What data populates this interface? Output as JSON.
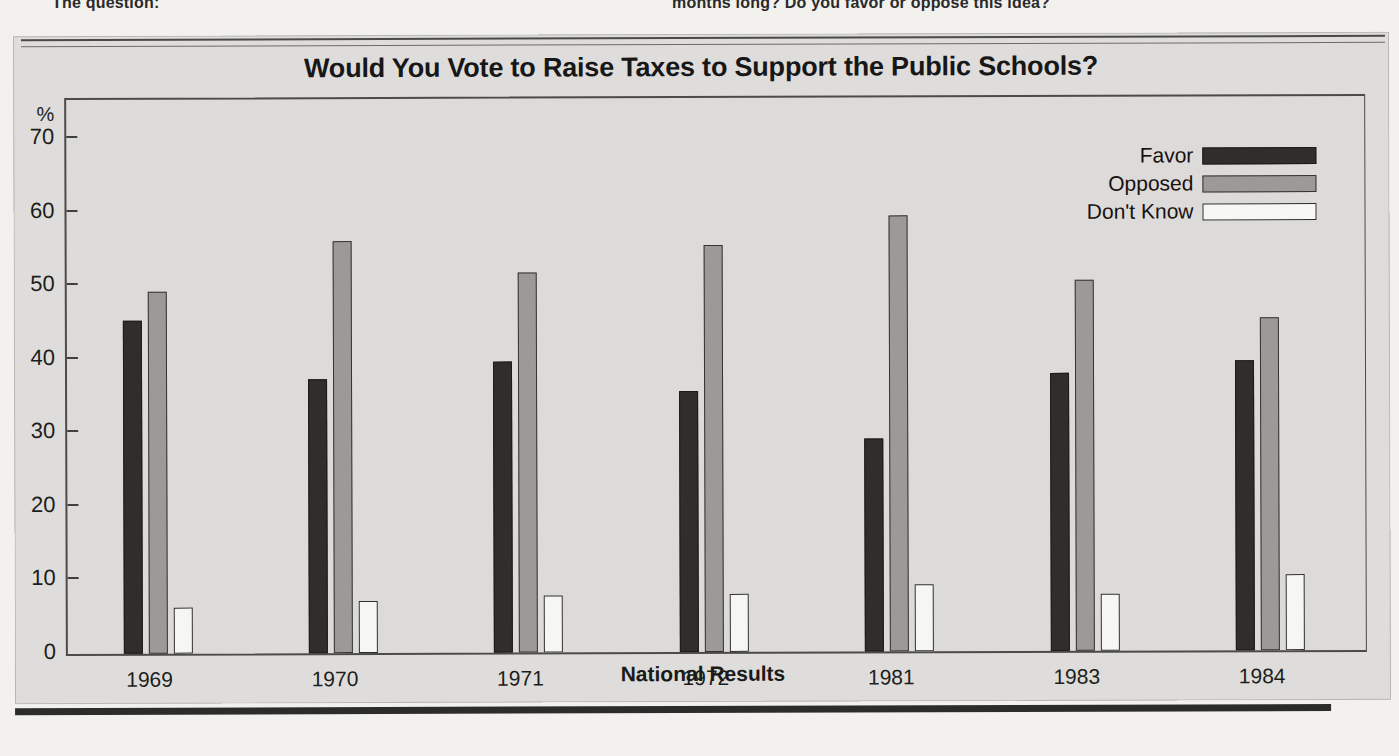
{
  "page_fragments": {
    "left": "The question:",
    "right": "months long? Do you favor or oppose this idea?"
  },
  "figure": {
    "title": "Would You Vote to Raise Taxes to Support the Public Schools?",
    "axis_caption": "National Results",
    "percent_symbol": "%"
  },
  "legend": {
    "position": "top-right",
    "items": [
      {
        "label": "Favor",
        "color": "#2f2e2d"
      },
      {
        "label": "Opposed",
        "color": "#9b9a97"
      },
      {
        "label": "Don't Know",
        "color": "#f7f7f4"
      }
    ]
  },
  "chart_data": {
    "type": "bar",
    "title": "Would You Vote to Raise Taxes to Support the Public Schools?",
    "xlabel": "National Results",
    "ylabel": "%",
    "ylim": [
      0,
      70
    ],
    "yticks": [
      0,
      10,
      20,
      30,
      40,
      50,
      60,
      70
    ],
    "grid": false,
    "legend_position": "top-right",
    "categories": [
      "1969",
      "1970",
      "1971",
      "1972",
      "1981",
      "1983",
      "1984"
    ],
    "series": [
      {
        "name": "Favor",
        "color": "#2f2e2d",
        "values": [
          45.0,
          37.0,
          39.3,
          35.2,
          28.7,
          37.5,
          39.2
        ]
      },
      {
        "name": "Opposed",
        "color": "#9b9a97",
        "values": [
          49.0,
          55.7,
          51.4,
          55.0,
          59.0,
          50.2,
          45.0
        ]
      },
      {
        "name": "Don't Know",
        "color": "#f7f7f4",
        "values": [
          6.0,
          6.8,
          7.5,
          7.6,
          8.8,
          7.5,
          10.0
        ]
      }
    ]
  }
}
